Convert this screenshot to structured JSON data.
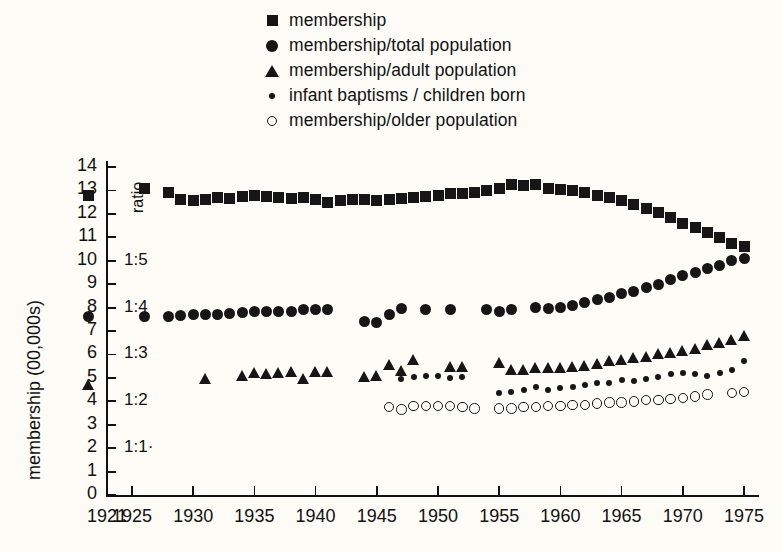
{
  "legend": {
    "items": [
      {
        "marker": "filled-square-icon",
        "label": "membership"
      },
      {
        "marker": "filled-circle-icon",
        "label": "membership/total population"
      },
      {
        "marker": "filled-triangle-icon",
        "label": "membership/adult population"
      },
      {
        "marker": "small-dot-icon",
        "label": "infant baptisms / children born"
      },
      {
        "marker": "open-circle-icon",
        "label": "membership/older population"
      }
    ]
  },
  "axes": {
    "y_title": "membership (00,000s)",
    "ratio_title": "ratio",
    "y_ticks": [
      "0",
      "1",
      "2",
      "3",
      "4",
      "5",
      "6",
      "7",
      "8",
      "9",
      "10",
      "11",
      "12",
      "13",
      "14"
    ],
    "ratio_ticks": [
      {
        "value": 2,
        "label": "1:1·"
      },
      {
        "value": 4,
        "label": "1:2"
      },
      {
        "value": 6,
        "label": "1:3"
      },
      {
        "value": 8,
        "label": "1:4"
      },
      {
        "value": 10,
        "label": "1:5"
      }
    ],
    "x_ticks": [
      "1921",
      "1925",
      "1930",
      "1935",
      "1940",
      "1945",
      "1950",
      "1955",
      "1960",
      "1965",
      "1970",
      "1975"
    ]
  },
  "chart_data": {
    "type": "scatter",
    "title": "",
    "xlabel": "",
    "ylabel": "membership (00,000s)",
    "xlim": [
      1921,
      1976
    ],
    "ylim": [
      0,
      14
    ],
    "grid": false,
    "legend_position": "top",
    "secondary_axis": {
      "label": "ratio",
      "ticks": [
        {
          "y": 2,
          "label": "1:1"
        },
        {
          "y": 4,
          "label": "1:2"
        },
        {
          "y": 6,
          "label": "1:3"
        },
        {
          "y": 8,
          "label": "1:4"
        },
        {
          "y": 10,
          "label": "1:5"
        }
      ]
    },
    "series": [
      {
        "name": "membership",
        "marker": "filled-square",
        "color": "#161616",
        "points": [
          [
            1921,
            12.8
          ],
          [
            1926,
            13.1
          ],
          [
            1928,
            12.9
          ],
          [
            1929,
            12.6
          ],
          [
            1930,
            12.55
          ],
          [
            1931,
            12.6
          ],
          [
            1932,
            12.7
          ],
          [
            1933,
            12.65
          ],
          [
            1934,
            12.75
          ],
          [
            1935,
            12.8
          ],
          [
            1936,
            12.75
          ],
          [
            1937,
            12.7
          ],
          [
            1938,
            12.65
          ],
          [
            1939,
            12.7
          ],
          [
            1940,
            12.6
          ],
          [
            1941,
            12.5
          ],
          [
            1942,
            12.55
          ],
          [
            1943,
            12.6
          ],
          [
            1944,
            12.6
          ],
          [
            1945,
            12.55
          ],
          [
            1946,
            12.6
          ],
          [
            1947,
            12.65
          ],
          [
            1948,
            12.7
          ],
          [
            1949,
            12.75
          ],
          [
            1950,
            12.8
          ],
          [
            1951,
            12.85
          ],
          [
            1952,
            12.85
          ],
          [
            1953,
            12.9
          ],
          [
            1954,
            13.0
          ],
          [
            1955,
            13.1
          ],
          [
            1956,
            13.25
          ],
          [
            1957,
            13.2
          ],
          [
            1958,
            13.25
          ],
          [
            1959,
            13.1
          ],
          [
            1960,
            13.05
          ],
          [
            1961,
            13.0
          ],
          [
            1962,
            12.9
          ],
          [
            1963,
            12.8
          ],
          [
            1964,
            12.7
          ],
          [
            1965,
            12.55
          ],
          [
            1966,
            12.4
          ],
          [
            1967,
            12.25
          ],
          [
            1968,
            12.05
          ],
          [
            1969,
            11.85
          ],
          [
            1970,
            11.6
          ],
          [
            1971,
            11.4
          ],
          [
            1972,
            11.2
          ],
          [
            1973,
            11.0
          ],
          [
            1974,
            10.75
          ],
          [
            1975,
            10.6
          ]
        ]
      },
      {
        "name": "membership/total population",
        "marker": "filled-circle",
        "color": "#161616",
        "points": [
          [
            1921,
            7.6
          ],
          [
            1926,
            7.6
          ],
          [
            1928,
            7.6
          ],
          [
            1929,
            7.65
          ],
          [
            1930,
            7.7
          ],
          [
            1931,
            7.7
          ],
          [
            1932,
            7.7
          ],
          [
            1933,
            7.75
          ],
          [
            1934,
            7.8
          ],
          [
            1935,
            7.85
          ],
          [
            1936,
            7.85
          ],
          [
            1937,
            7.85
          ],
          [
            1938,
            7.85
          ],
          [
            1939,
            7.9
          ],
          [
            1940,
            7.9
          ],
          [
            1941,
            7.9
          ],
          [
            1944,
            7.4
          ],
          [
            1945,
            7.35
          ],
          [
            1946,
            7.7
          ],
          [
            1947,
            7.95
          ],
          [
            1949,
            7.9
          ],
          [
            1951,
            7.9
          ],
          [
            1954,
            7.9
          ],
          [
            1955,
            7.85
          ],
          [
            1956,
            7.9
          ],
          [
            1958,
            8.0
          ],
          [
            1959,
            7.95
          ],
          [
            1960,
            8.0
          ],
          [
            1961,
            8.1
          ],
          [
            1962,
            8.2
          ],
          [
            1963,
            8.35
          ],
          [
            1964,
            8.45
          ],
          [
            1965,
            8.6
          ],
          [
            1966,
            8.7
          ],
          [
            1967,
            8.85
          ],
          [
            1968,
            9.0
          ],
          [
            1969,
            9.2
          ],
          [
            1970,
            9.35
          ],
          [
            1971,
            9.5
          ],
          [
            1972,
            9.65
          ],
          [
            1973,
            9.8
          ],
          [
            1974,
            10.0
          ],
          [
            1975,
            10.1
          ]
        ]
      },
      {
        "name": "membership/adult population",
        "marker": "filled-triangle",
        "color": "#161616",
        "points": [
          [
            1921,
            4.7
          ],
          [
            1931,
            4.95
          ],
          [
            1934,
            5.1
          ],
          [
            1935,
            5.2
          ],
          [
            1936,
            5.15
          ],
          [
            1937,
            5.2
          ],
          [
            1938,
            5.25
          ],
          [
            1939,
            4.95
          ],
          [
            1940,
            5.25
          ],
          [
            1941,
            5.25
          ],
          [
            1944,
            5.05
          ],
          [
            1945,
            5.1
          ],
          [
            1946,
            5.55
          ],
          [
            1947,
            5.3
          ],
          [
            1948,
            5.75
          ],
          [
            1951,
            5.45
          ],
          [
            1952,
            5.45
          ],
          [
            1955,
            5.65
          ],
          [
            1956,
            5.35
          ],
          [
            1957,
            5.35
          ],
          [
            1958,
            5.4
          ],
          [
            1959,
            5.4
          ],
          [
            1960,
            5.4
          ],
          [
            1961,
            5.45
          ],
          [
            1962,
            5.5
          ],
          [
            1963,
            5.6
          ],
          [
            1964,
            5.7
          ],
          [
            1965,
            5.75
          ],
          [
            1966,
            5.85
          ],
          [
            1967,
            5.9
          ],
          [
            1968,
            6.0
          ],
          [
            1969,
            6.05
          ],
          [
            1970,
            6.15
          ],
          [
            1971,
            6.25
          ],
          [
            1972,
            6.4
          ],
          [
            1973,
            6.5
          ],
          [
            1974,
            6.6
          ],
          [
            1975,
            6.8
          ]
        ]
      },
      {
        "name": "infant baptisms / children born",
        "marker": "small-dot",
        "color": "#161616",
        "points": [
          [
            1947,
            4.95
          ],
          [
            1948,
            5.05
          ],
          [
            1949,
            5.1
          ],
          [
            1950,
            5.1
          ],
          [
            1951,
            5.0
          ],
          [
            1952,
            5.05
          ],
          [
            1955,
            4.35
          ],
          [
            1956,
            4.4
          ],
          [
            1957,
            4.5
          ],
          [
            1958,
            4.6
          ],
          [
            1959,
            4.5
          ],
          [
            1960,
            4.55
          ],
          [
            1961,
            4.6
          ],
          [
            1962,
            4.7
          ],
          [
            1963,
            4.8
          ],
          [
            1964,
            4.8
          ],
          [
            1965,
            4.9
          ],
          [
            1966,
            4.85
          ],
          [
            1967,
            4.95
          ],
          [
            1968,
            5.05
          ],
          [
            1969,
            5.15
          ],
          [
            1970,
            5.2
          ],
          [
            1971,
            5.15
          ],
          [
            1972,
            5.1
          ],
          [
            1973,
            5.2
          ],
          [
            1974,
            5.35
          ],
          [
            1975,
            5.7
          ]
        ]
      },
      {
        "name": "membership/older population",
        "marker": "open-circle",
        "color": "#161616",
        "points": [
          [
            1946,
            3.75
          ],
          [
            1947,
            3.65
          ],
          [
            1948,
            3.8
          ],
          [
            1949,
            3.8
          ],
          [
            1950,
            3.8
          ],
          [
            1951,
            3.8
          ],
          [
            1952,
            3.75
          ],
          [
            1953,
            3.7
          ],
          [
            1955,
            3.7
          ],
          [
            1956,
            3.7
          ],
          [
            1957,
            3.75
          ],
          [
            1958,
            3.75
          ],
          [
            1959,
            3.8
          ],
          [
            1960,
            3.8
          ],
          [
            1961,
            3.85
          ],
          [
            1962,
            3.85
          ],
          [
            1963,
            3.9
          ],
          [
            1964,
            3.95
          ],
          [
            1965,
            3.95
          ],
          [
            1966,
            4.0
          ],
          [
            1967,
            4.05
          ],
          [
            1968,
            4.05
          ],
          [
            1969,
            4.1
          ],
          [
            1970,
            4.15
          ],
          [
            1971,
            4.2
          ],
          [
            1972,
            4.3
          ],
          [
            1974,
            4.35
          ],
          [
            1975,
            4.4
          ]
        ]
      }
    ]
  }
}
